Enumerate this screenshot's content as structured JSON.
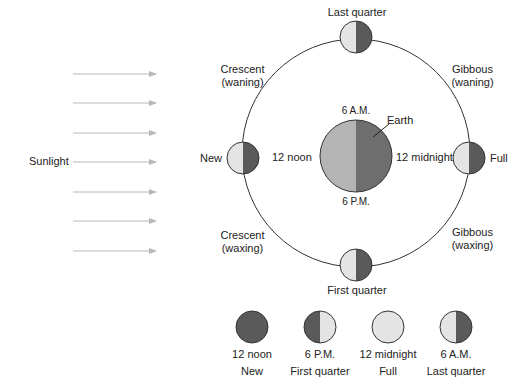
{
  "colors": {
    "dark": "#5a5a5a",
    "light": "#e4e4e4",
    "earth_light": "#b4b4b4",
    "earth_dark": "#6e6e6e",
    "orbit": "#333333",
    "arrow": "#b8b8b8"
  },
  "sunlight": {
    "label": "Sunlight",
    "arrow_count": 7
  },
  "orbit": {
    "phases": {
      "top": "Last quarter",
      "bottom": "First quarter",
      "left": "New",
      "right": "Full",
      "upper_left": {
        "line1": "Crescent",
        "line2": "(waning)"
      },
      "upper_right": {
        "line1": "Gibbous",
        "line2": "(waning)"
      },
      "lower_left": {
        "line1": "Crescent",
        "line2": "(waxing)"
      },
      "lower_right": {
        "line1": "Gibbous",
        "line2": "(waxing)"
      }
    }
  },
  "earth": {
    "label": "Earth",
    "times": {
      "top": "6 A.M.",
      "bottom": "6 P.M.",
      "left": "12 noon",
      "right": "12 midnight"
    }
  },
  "legend": [
    {
      "time": "12 noon",
      "phase": "New"
    },
    {
      "time": "6 P.M.",
      "phase": "First quarter"
    },
    {
      "time": "12 midnight",
      "phase": "Full"
    },
    {
      "time": "6 A.M.",
      "phase": "Last quarter"
    }
  ]
}
